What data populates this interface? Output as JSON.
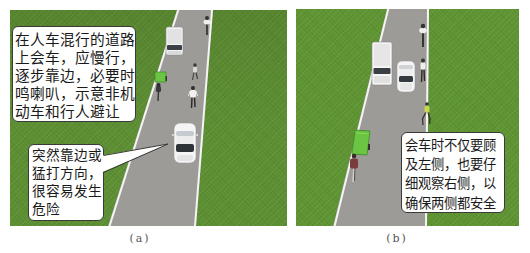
{
  "figure": {
    "panels": [
      {
        "id": "a",
        "caption": "(a)",
        "callouts": [
          {
            "lines": [
              "在人车混行的道路",
              "上会车，应慢行，",
              "逐步靠边，必要时",
              "鸣喇叭，示意非机",
              "动车和行人避让"
            ]
          },
          {
            "lines": [
              "突然靠边或",
              "猛打方向，",
              "很容易发生",
              "危险"
            ]
          }
        ],
        "scene_objects": [
          "white-van",
          "cyclist",
          "cargo-tricycle",
          "tricycle-rider",
          "pedestrian",
          "pedestrian",
          "white-car"
        ]
      },
      {
        "id": "b",
        "caption": "(b)",
        "callouts": [
          {
            "lines": [
              "会车时不仅要顾",
              "及左侧，也要仔",
              "细观察右侧，以",
              "确保两侧都安全"
            ]
          }
        ],
        "scene_objects": [
          "white-van",
          "white-car",
          "cyclist",
          "pedestrian",
          "pedestrian",
          "cargo-tricycle",
          "tricycle-rider"
        ]
      }
    ]
  },
  "colors": {
    "grass": "#5d8f33",
    "road": "#9d9b98",
    "road_line": "#f4f4f4",
    "callout_bg": "#ffffff",
    "callout_border": "#3a3a3a",
    "callout_text": "#1a1a1a",
    "caption_text": "#555555",
    "cargo_green": "#6cc443"
  }
}
